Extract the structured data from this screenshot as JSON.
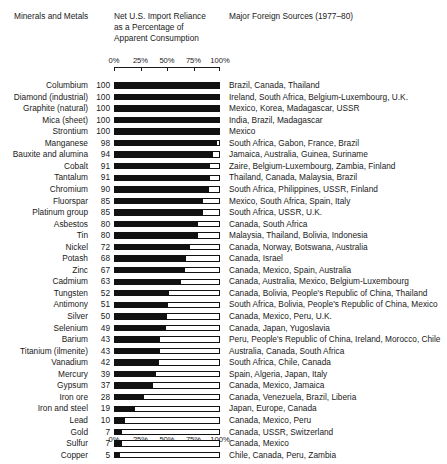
{
  "headers": {
    "minerals": "Minerals and Metals",
    "reliance_line1": "Net U.S. Import Reliance",
    "reliance_line2": "as a Percentage of",
    "reliance_line3": "Apparent Consumption",
    "sources": "Major Foreign Sources (1977–80)"
  },
  "axis": {
    "ticks": [
      "0%",
      "25%",
      "50%",
      "75%",
      "100%"
    ],
    "tick_values": [
      0,
      25,
      50,
      75,
      100
    ]
  },
  "chart_data": {
    "type": "bar",
    "title": "Net U.S. Import Reliance as a Percentage of Apparent Consumption",
    "subtitle": "Major Foreign Sources (1977–80)",
    "xlabel": "",
    "ylabel": "Minerals and Metals",
    "xlim": [
      0,
      100
    ],
    "grid": false,
    "legend": "none",
    "orientation": "horizontal",
    "categories": [
      "Columbium",
      "Diamond (industrial)",
      "Graphite (natural)",
      "Mica (sheet)",
      "Strontium",
      "Manganese",
      "Bauxite and alumina",
      "Cobalt",
      "Tantalum",
      "Chromium",
      "Fluorspar",
      "Platinum group",
      "Asbestos",
      "Tin",
      "Nickel",
      "Potash",
      "Zinc",
      "Cadmium",
      "Tungsten",
      "Antimony",
      "Silver",
      "Selenium",
      "Barium",
      "Titanium (ilmenite)",
      "Vanadium",
      "Mercury",
      "Gypsum",
      "Iron ore",
      "Iron and steel",
      "Lead",
      "Gold",
      "Sulfur",
      "Copper"
    ],
    "values": [
      100,
      100,
      100,
      100,
      100,
      98,
      94,
      91,
      91,
      90,
      85,
      85,
      80,
      80,
      72,
      68,
      67,
      63,
      52,
      51,
      50,
      49,
      43,
      43,
      42,
      39,
      37,
      28,
      19,
      10,
      7,
      7,
      5
    ],
    "annotations": [
      "Brazil, Canada, Thailand",
      "Ireland, South Africa, Belgium-Luxembourg, U.K.",
      "Mexico, Korea, Madagascar, USSR",
      "India, Brazil, Madagascar",
      "Mexico",
      "South Africa, Gabon, France, Brazil",
      "Jamaica, Australia, Guinea, Suriname",
      "Zaire, Belgium-Luxembourg, Zambia, Finland",
      "Thailand, Canada, Malaysia, Brazil",
      "South Africa, Philippines, USSR, Finland",
      "Mexico, South Africa, Spain, Italy",
      "South Africa, USSR, U.K.",
      "Canada, South Africa",
      "Malaysia, Thailand, Bolivia, Indonesia",
      "Canada, Norway, Botswana, Australia",
      "Canada, Israel",
      "Canada, Mexico, Spain, Australia",
      "Canada, Australia, Mexico, Belgium-Luxembourg",
      "Canada, Bolivia, People's Republic of China, Thailand",
      "South Africa, Bolivia, People's Republic of China, Mexico",
      "Canada, Mexico, Peru, U.K.",
      "Canada, Japan, Yugoslavia",
      "Peru, People's Republic of China, Ireland, Morocco, Chile",
      "Australia, Canada, South Africa",
      "South Africa, Chile, Canada",
      "Spain, Algeria, Japan, Italy",
      "Canada, Mexico, Jamaica",
      "Canada, Venezuela, Brazil, Liberia",
      "Japan, Europe, Canada",
      "Canada, Mexico, Peru",
      "Canada, USSR, Switzerland",
      "Canada, Mexico",
      "Chile, Canada, Peru, Zambia"
    ]
  },
  "colors": {
    "bar_fill": "#111111",
    "bar_outline": "#111111",
    "background": "#ffffff",
    "text": "#1a1a1a"
  }
}
